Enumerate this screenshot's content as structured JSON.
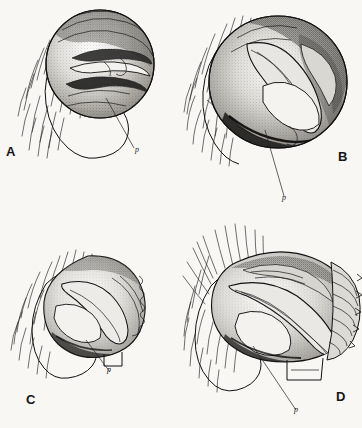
{
  "plate": {
    "title": "Comparative plate of male palpal bulbs",
    "background_color": "#f8f7f4",
    "ink_color": "#1a1a1a",
    "width": 362,
    "height": 428,
    "layout": "2x2 grid of four uncaptioned figure panels",
    "technique": "stipple and line drawing"
  },
  "panels": [
    {
      "id": "a",
      "letter": "A",
      "letter_position": "bottom-left",
      "leader_label": "p",
      "description": "Ventral view of palpal bulb, sub-circular, with cymbium and setae at left",
      "outline_shape": "circular",
      "relative_size": "medium"
    },
    {
      "id": "b",
      "letter": "B",
      "letter_position": "bottom-right",
      "leader_label": "p",
      "description": "Larger sub-circular palpal bulb with prominent embolus and heavy dark shading",
      "outline_shape": "circular",
      "relative_size": "large"
    },
    {
      "id": "c",
      "letter": "C",
      "letter_position": "bottom-left",
      "leader_label": "p",
      "description": "Smaller compact palpal bulb with crenulate margin at right",
      "outline_shape": "rounded",
      "relative_size": "small"
    },
    {
      "id": "d",
      "letter": "D",
      "letter_position": "bottom-right",
      "leader_label": "p",
      "description": "Broad elongate palpal bulb with conspicuous lamellate ridged conductor at right",
      "outline_shape": "elongate",
      "relative_size": "large"
    }
  ],
  "annotations": {
    "leader_line_count": 4,
    "leader_label_text": "p",
    "leader_label_style": "italic lowercase"
  }
}
